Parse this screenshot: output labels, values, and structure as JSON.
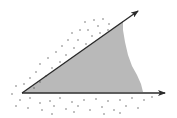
{
  "diagram": {
    "colors": {
      "background": "#ffffff",
      "ray": "#2a2a2a",
      "interior_fill": "#b9b9b9",
      "dots": "#555555"
    },
    "vertex": [
      22,
      93
    ],
    "rays": [
      {
        "name": "upper-ray",
        "from": [
          22,
          93
        ],
        "to": [
          138,
          11
        ]
      },
      {
        "name": "lower-ray",
        "from": [
          22,
          93
        ],
        "to": [
          165,
          93
        ]
      }
    ],
    "interior_region_points": "22,93 123,21 123,30 125,42 128,55 132,66 137,75 141,84 143,92",
    "exterior_dots": [
      [
        85,
        22
      ],
      [
        94,
        20
      ],
      [
        103,
        19
      ],
      [
        109,
        24
      ],
      [
        98,
        26
      ],
      [
        88,
        30
      ],
      [
        80,
        30
      ],
      [
        72,
        33
      ],
      [
        92,
        36
      ],
      [
        100,
        33
      ],
      [
        108,
        30
      ],
      [
        68,
        40
      ],
      [
        78,
        40
      ],
      [
        86,
        44
      ],
      [
        62,
        46
      ],
      [
        74,
        48
      ],
      [
        56,
        52
      ],
      [
        66,
        55
      ],
      [
        48,
        58
      ],
      [
        60,
        62
      ],
      [
        40,
        64
      ],
      [
        52,
        68
      ],
      [
        36,
        72
      ],
      [
        46,
        76
      ],
      [
        30,
        78
      ],
      [
        40,
        82
      ],
      [
        24,
        84
      ],
      [
        34,
        88
      ],
      [
        16,
        86
      ],
      [
        12,
        94
      ],
      [
        20,
        100
      ],
      [
        30,
        98
      ],
      [
        40,
        103
      ],
      [
        50,
        101
      ],
      [
        60,
        98
      ],
      [
        72,
        102
      ],
      [
        84,
        100
      ],
      [
        96,
        99
      ],
      [
        108,
        101
      ],
      [
        120,
        100
      ],
      [
        132,
        98
      ],
      [
        144,
        100
      ],
      [
        152,
        97
      ],
      [
        16,
        106
      ],
      [
        28,
        108
      ],
      [
        42,
        110
      ],
      [
        54,
        106
      ],
      [
        66,
        109
      ],
      [
        78,
        106
      ],
      [
        90,
        110
      ],
      [
        102,
        107
      ],
      [
        114,
        110
      ],
      [
        126,
        106
      ],
      [
        138,
        108
      ],
      [
        52,
        114
      ],
      [
        74,
        112
      ],
      [
        104,
        114
      ],
      [
        120,
        113
      ]
    ]
  }
}
